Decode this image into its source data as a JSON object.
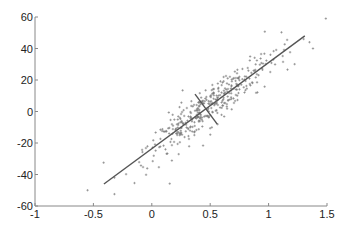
{
  "chart_data": {
    "type": "scatter",
    "title": "",
    "xlabel": "",
    "ylabel": "",
    "xlim": [
      -1,
      1.5
    ],
    "ylim": [
      -60,
      60
    ],
    "grid": false,
    "legend": null,
    "x_ticks": [
      "-1",
      "-0.5",
      "0",
      "0.5",
      "1",
      "1.5"
    ],
    "y_ticks": [
      "60",
      "40",
      "20",
      "0",
      "-20",
      "-40",
      "-60"
    ],
    "x_tick_values": [
      -1,
      -0.5,
      0,
      0.5,
      1,
      1.5
    ],
    "y_tick_values": [
      60,
      40,
      20,
      0,
      -20,
      -40,
      -60
    ],
    "marker": "+",
    "marker_color": "#777777",
    "line_color": "#555555",
    "annotations": [
      {
        "type": "line",
        "name": "principal-axis",
        "x": [
          -0.41,
          1.31
        ],
        "y": [
          -46,
          48
        ]
      },
      {
        "type": "line",
        "name": "secondary-axis",
        "x": [
          0.37,
          0.56
        ],
        "y": [
          11,
          -8
        ]
      }
    ],
    "series": [
      {
        "name": "samples",
        "seed": 7,
        "n": 380,
        "model": {
          "slope": 54.7,
          "intercept": -23.6,
          "x_mean": 0.5,
          "x_sd": 0.28,
          "y_noise_sd": 6.5
        },
        "extra_points": [
          [
            1.49,
            59
          ],
          [
            -0.55,
            -50
          ],
          [
            -0.32,
            -42
          ],
          [
            1.3,
            46
          ],
          [
            1.35,
            44
          ],
          [
            1.38,
            40
          ]
        ]
      }
    ]
  }
}
